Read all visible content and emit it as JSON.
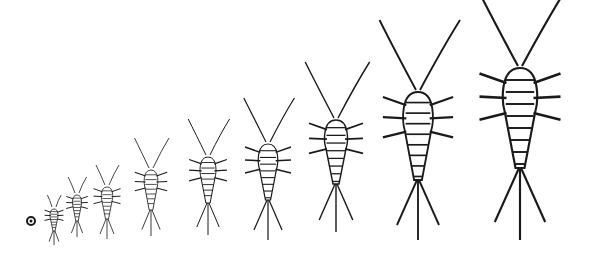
{
  "figure": {
    "background": "#ffffff",
    "ink": "#1a1a1a",
    "egg": {
      "cx": 31,
      "cy": 221,
      "r": 4
    },
    "stages": [
      {
        "label": "stage-1",
        "cx": 54,
        "head_y": 207,
        "body_len": 22,
        "body_w": 7,
        "ant": 12,
        "tail": 14
      },
      {
        "label": "stage-2",
        "cx": 77,
        "head_y": 193,
        "body_len": 26,
        "body_w": 8,
        "ant": 16,
        "tail": 16
      },
      {
        "label": "stage-3",
        "cx": 107,
        "head_y": 185,
        "body_len": 32,
        "body_w": 10,
        "ant": 20,
        "tail": 20
      },
      {
        "label": "stage-4",
        "cx": 151,
        "head_y": 168,
        "body_len": 40,
        "body_w": 12,
        "ant": 30,
        "tail": 26
      },
      {
        "label": "stage-5",
        "cx": 208,
        "head_y": 155,
        "body_len": 46,
        "body_w": 14,
        "ant": 36,
        "tail": 32
      },
      {
        "label": "stage-6",
        "cx": 268,
        "head_y": 142,
        "body_len": 56,
        "body_w": 17,
        "ant": 44,
        "tail": 40
      },
      {
        "label": "stage-7",
        "cx": 336,
        "head_y": 118,
        "body_len": 64,
        "body_w": 20,
        "ant": 56,
        "tail": 48
      },
      {
        "label": "stage-8",
        "cx": 418,
        "head_y": 90,
        "body_len": 88,
        "body_w": 26,
        "ant": 70,
        "tail": 60
      },
      {
        "label": "stage-9",
        "cx": 520,
        "head_y": 66,
        "body_len": 100,
        "body_w": 30,
        "ant": 78,
        "tail": 72
      }
    ]
  }
}
